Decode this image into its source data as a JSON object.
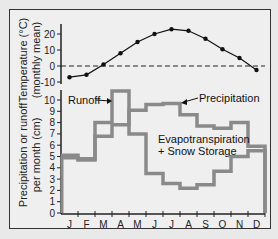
{
  "chart_data": [
    {
      "type": "line",
      "title": "",
      "xlabel": "",
      "ylabel": "Temperature (°C) (monthly mean)",
      "ylabel_line1": "Temperature (°C)",
      "ylabel_line2": "(monthly mean)",
      "categories": [
        "J",
        "F",
        "M",
        "A",
        "M",
        "J",
        "J",
        "A",
        "S",
        "O",
        "N",
        "D"
      ],
      "values": [
        -7,
        -5.5,
        1,
        8,
        15,
        20,
        23,
        22,
        17,
        10.5,
        5,
        -2.5
      ],
      "yticks": [
        20,
        10,
        0,
        -10
      ],
      "ylim": [
        -10,
        25
      ],
      "reference_line": {
        "y": 0,
        "style": "dashed"
      },
      "markers": true,
      "grid": false
    },
    {
      "type": "line",
      "step": true,
      "title": "",
      "xlabel": "",
      "ylabel": "Precipitation or runoff per month (cm)",
      "ylabel_line1": "Precipitation or runoff",
      "ylabel_line2": "per month (cm)",
      "categories": [
        "J",
        "F",
        "M",
        "A",
        "M",
        "J",
        "J",
        "A",
        "S",
        "O",
        "N",
        "D"
      ],
      "series": [
        {
          "name": "Precipitation",
          "values": [
            5.1,
            4.8,
            6.8,
            7.8,
            9.1,
            9.6,
            9.7,
            8.7,
            7.7,
            7.5,
            8.0,
            5.9
          ]
        },
        {
          "name": "Runoff",
          "values": [
            4.9,
            4.7,
            8.0,
            10.8,
            7.0,
            3.5,
            2.6,
            2.2,
            2.5,
            3.7,
            5.0,
            5.5
          ]
        }
      ],
      "yticks": [
        0,
        1,
        2,
        3,
        4,
        5,
        6,
        7,
        8,
        9,
        10
      ],
      "ylim": [
        0,
        11
      ],
      "annotations": [
        {
          "text": "Runoff",
          "arrow_to": "Runoff"
        },
        {
          "text": "Precipitation",
          "arrow_to": "Precipitation"
        },
        {
          "text": "Evapotranspiration",
          "line": 1
        },
        {
          "text": "+ Snow Storage",
          "line": 2
        }
      ],
      "grid": false
    }
  ],
  "labels": {
    "temp_axis_1": "Temperature (°C)",
    "temp_axis_2": "(monthly mean)",
    "precip_axis_1": "Precipitation or runoff",
    "precip_axis_2": "per month (cm)",
    "runoff": "Runoff",
    "precipitation": "Precipitation",
    "evap_1": "Evapotranspiration",
    "evap_2": "+ Snow Storage"
  },
  "colors": {
    "background": "#e9e9e9",
    "panel": "#efefef",
    "axis": "#222222",
    "step_lines": "#8a8a8a",
    "temp_line": "#111111"
  }
}
